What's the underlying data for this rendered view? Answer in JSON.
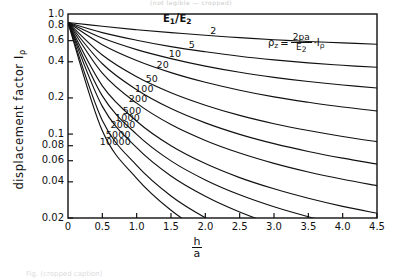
{
  "figure": {
    "top_cropped_text": "(not legible — cropped)",
    "bottom_cropped_caption": "Fig. (cropped caption)"
  },
  "chart_data": {
    "type": "line",
    "title": "",
    "xlabel": "h/a",
    "xlabel_numerator": "h",
    "xlabel_denominator": "a",
    "ylabel": "displacement factor I",
    "ylabel_subscript": "ρ",
    "xlim": [
      0,
      4.5
    ],
    "ylim": [
      0.02,
      1.0
    ],
    "yscale": "log",
    "xscale": "linear",
    "grid": false,
    "legend_position": "inline-curve-labels",
    "xticks": [
      "0",
      "0.5",
      "1.0",
      "1.5",
      "2.0",
      "2.5",
      "3.0",
      "3.5",
      "4.0",
      "4.5"
    ],
    "xtick_values": [
      0,
      0.5,
      1.0,
      1.5,
      2.0,
      2.5,
      3.0,
      3.5,
      4.0,
      4.5
    ],
    "yticks": [
      "1.0",
      "0.8",
      "0.6",
      "0.4",
      "0.2",
      "0.1",
      "0.08",
      "0.06",
      "0.04",
      "0.02"
    ],
    "ytick_values": [
      1.0,
      0.8,
      0.6,
      0.4,
      0.2,
      0.1,
      0.08,
      0.06,
      0.04,
      0.02
    ],
    "series_parameter_name": "E1/E2",
    "annotations": [
      {
        "name": "ratio-heading",
        "text": "E₁/E₂"
      },
      {
        "name": "formula",
        "text": "ρz = (2pa/E₂)·Iρ"
      }
    ],
    "formula": {
      "lhs": "ρ",
      "lhs_sub": "z",
      "eq": "=",
      "numerator": "2pa",
      "denominator": "E",
      "denominator_sub": "2",
      "factor": "·I",
      "factor_sub": "ρ"
    },
    "series": [
      {
        "name": "2",
        "label": "2",
        "values": [
          0.85,
          0.79,
          0.74,
          0.7,
          0.665,
          0.635,
          0.61,
          0.59,
          0.575,
          0.56
        ]
      },
      {
        "name": "5",
        "label": "5",
        "values": [
          0.85,
          0.7,
          0.605,
          0.535,
          0.485,
          0.445,
          0.415,
          0.392,
          0.374,
          0.36
        ]
      },
      {
        "name": "10",
        "label": "10",
        "values": [
          0.85,
          0.63,
          0.505,
          0.425,
          0.368,
          0.327,
          0.297,
          0.274,
          0.256,
          0.242
        ]
      },
      {
        "name": "20",
        "label": "20",
        "values": [
          0.85,
          0.555,
          0.41,
          0.325,
          0.27,
          0.232,
          0.204,
          0.184,
          0.168,
          0.156
        ]
      },
      {
        "name": "50",
        "label": "50",
        "values": [
          0.85,
          0.455,
          0.3,
          0.221,
          0.174,
          0.143,
          0.122,
          0.107,
          0.0955,
          0.0865
        ]
      },
      {
        "name": "100",
        "label": "100",
        "values": [
          0.85,
          0.385,
          0.234,
          0.163,
          0.124,
          0.0995,
          0.0832,
          0.0716,
          0.063,
          0.0563
        ]
      },
      {
        "name": "200",
        "label": "200",
        "values": [
          0.85,
          0.322,
          0.181,
          0.12,
          0.0885,
          0.0695,
          0.057,
          0.0483,
          0.042,
          0.0372
        ]
      },
      {
        "name": "500",
        "label": "500",
        "values": [
          0.85,
          0.252,
          0.128,
          0.08,
          0.0568,
          0.0434,
          0.035,
          0.0292,
          0.025,
          0.0219
        ]
      },
      {
        "name": "1000",
        "label": "1000",
        "values": [
          0.85,
          0.208,
          0.0995,
          0.0598,
          0.0415,
          0.0312,
          0.0248,
          0.0205,
          0.0174,
          0.0151
        ]
      },
      {
        "name": "2000",
        "label": "2000",
        "values": [
          0.85,
          0.17,
          0.077,
          0.0447,
          0.0303,
          0.0224,
          0.0176,
          0.0144,
          0.0121,
          0.0104
        ]
      },
      {
        "name": "5000",
        "label": "5000",
        "values": [
          0.85,
          0.13,
          0.0548,
          0.0305,
          0.0201,
          0.0146,
          0.0113,
          0.0091,
          0.0076,
          0.0065
        ]
      },
      {
        "name": "10000",
        "label": "10000",
        "values": [
          0.85,
          0.1065,
          0.0428,
          0.0232,
          0.015,
          0.0108,
          0.0083,
          0.0066,
          0.0055,
          0.0046
        ]
      }
    ],
    "x_samples": [
      0,
      0.5,
      1.0,
      1.5,
      2.0,
      2.5,
      3.0,
      3.5,
      4.0,
      4.5
    ]
  }
}
